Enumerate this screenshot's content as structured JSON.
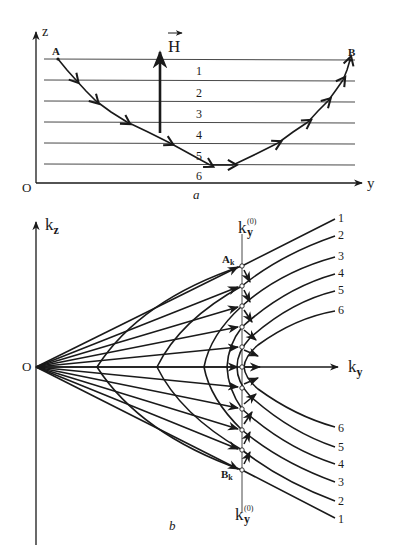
{
  "panel_a": {
    "caption": "a",
    "axes": {
      "vertical": "z",
      "horizontal": "y",
      "origin": "O"
    },
    "field_label": "H",
    "start_point": "A",
    "end_point": "B",
    "layers": [
      "1",
      "2",
      "3",
      "4",
      "5",
      "6"
    ]
  },
  "panel_b": {
    "caption": "b",
    "axes": {
      "vertical": "k",
      "vertical_sub": "z",
      "horizontal": "k",
      "horizontal_sub": "y",
      "origin": "O"
    },
    "ref_line": {
      "base": "k",
      "sub": "y",
      "sup": "(0)"
    },
    "point_top": {
      "base": "A",
      "sub": "k"
    },
    "point_bottom": {
      "base": "B",
      "sub": "k"
    },
    "curves_upper": [
      "1",
      "2",
      "3",
      "4",
      "5",
      "6"
    ],
    "curves_lower": [
      "6",
      "5",
      "4",
      "3",
      "2",
      "1"
    ]
  }
}
